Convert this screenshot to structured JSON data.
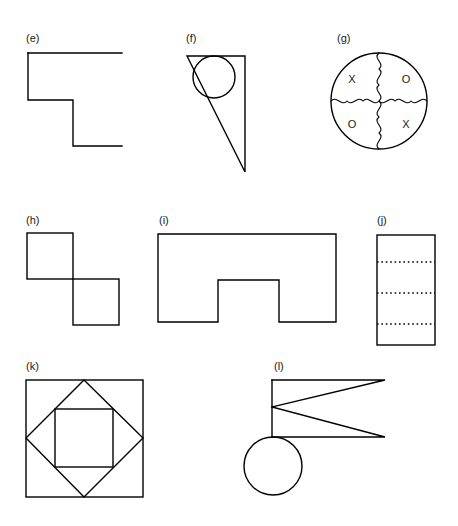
{
  "page": {
    "background_color": "#ffffff",
    "line_color": "#000000",
    "text_color": "#1a1a1a",
    "width": 458,
    "height": 526
  },
  "figures": [
    {
      "id": "e",
      "label": "(e)",
      "label_x": 26,
      "label_y": 42,
      "type": "open-polyline-staircase",
      "description": "Open staircase / Z-shaped polyline with two right-angle steps descending to the right",
      "points": "28,53 122,53 28,53 28,100 73,100 73,146 122,146"
    },
    {
      "id": "f",
      "label": "(f)",
      "label_x": 186,
      "label_y": 42,
      "type": "right-triangle-with-inscribed-circle",
      "description": "Right triangle with horizontal top edge and vertical right edge, apex pointing down; circle inscribed tangent to the top edge and both slanted sides",
      "triangle_points": "187,56 245,56 245,172",
      "circle_cx": 214,
      "circle_cy": 77,
      "circle_r": 21
    },
    {
      "id": "g",
      "label": "(g)",
      "label_x": 337,
      "label_y": 42,
      "type": "circle-quadrants-with-letters",
      "description": "Circle divided into four quadrants by a wavy vertical line and a wavy horizontal line; each quadrant contains a letter",
      "circle_cx": 379,
      "circle_cy": 101,
      "circle_r": 48,
      "quadrant_letters": [
        {
          "text": "X",
          "x": 352,
          "y": 80,
          "position": "top-left"
        },
        {
          "text": "O",
          "x": 406,
          "y": 80,
          "position": "top-right"
        },
        {
          "text": "O",
          "x": 352,
          "y": 125,
          "position": "bottom-left"
        },
        {
          "text": "X",
          "x": 406,
          "y": 125,
          "position": "bottom-right"
        }
      ]
    },
    {
      "id": "h",
      "label": "(h)",
      "label_x": 26,
      "label_y": 224,
      "type": "two-offset-squares",
      "description": "Two equal squares touching corner to corner, the second offset down and to the right",
      "square_a": {
        "x": 27,
        "y": 233,
        "w": 46,
        "h": 46
      },
      "square_b": {
        "x": 73,
        "y": 279,
        "w": 46,
        "h": 46
      }
    },
    {
      "id": "i",
      "label": "(i)",
      "label_x": 159,
      "label_y": 224,
      "type": "notched-rectangle",
      "description": "Rectangle with a rectangular notch cut out of the bottom edge, forming an inverted-U outline",
      "points": "158,234 336,234 336,322 279,322 279,280 218,280 218,322 158,322 158,234"
    },
    {
      "id": "j",
      "label": "(j)",
      "label_x": 377,
      "label_y": 224,
      "type": "rectangle-with-dotted-dividers",
      "description": "Tall rectangle crossed by three evenly spaced dotted horizontal lines",
      "rect": {
        "x": 377,
        "y": 235,
        "w": 58,
        "h": 110
      },
      "dotted_line_y": [
        262,
        293,
        324
      ]
    },
    {
      "id": "k",
      "label": "(k)",
      "label_x": 26,
      "label_y": 370,
      "type": "nested-square-diamond-square",
      "description": "Large square containing a rotated square (diamond) whose vertices touch the midpoints of the outer square's sides, and an upright inner square whose corners touch the diamond's edges",
      "outer_square": {
        "x": 26,
        "y": 380,
        "w": 117,
        "h": 117
      },
      "diamond_points": "84,380 143,438 84,497 26,438",
      "inner_square": {
        "x": 55,
        "y": 409,
        "w": 58,
        "h": 58
      }
    },
    {
      "id": "l",
      "label": "(l)",
      "label_x": 274,
      "label_y": 370,
      "type": "double-triangle-with-circle",
      "description": "Vertical bar on the left with two elongated triangles pointing right (forming a sideways zig-zag), and a circle tangent below the bar",
      "vertical_line": {
        "x": 272,
        "y1": 380,
        "y2": 437
      },
      "triangle_upper_points": "272,380 385,380 272,407",
      "triangle_lower_points": "272,407 385,437 272,437",
      "circle_cx": 273,
      "circle_cy": 466,
      "circle_r": 29
    }
  ]
}
